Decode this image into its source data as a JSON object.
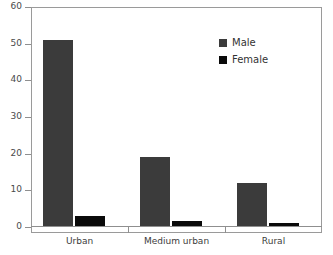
{
  "chart_data": {
    "type": "bar",
    "title": "",
    "subtitle": "",
    "xlabel": "",
    "ylabel": "",
    "categories": [
      "Urban",
      "Medium urban",
      "Rural"
    ],
    "series": [
      {
        "name": "Male",
        "color": "#3b3b3b",
        "values": [
          51,
          19,
          12
        ]
      },
      {
        "name": "Female",
        "color": "#0a0a0a",
        "values": [
          3,
          1.7,
          1.2
        ]
      }
    ],
    "ylim": [
      0,
      60
    ],
    "yticks": [
      0,
      10,
      20,
      30,
      40,
      50,
      60
    ],
    "ytick_labels": [
      "0",
      "10",
      "20",
      "30",
      "40",
      "50",
      "60"
    ],
    "grid": false,
    "legend": {
      "position": "upper-right-inside",
      "entries": [
        {
          "label": "Male",
          "swatch": "male-swatch",
          "color": "#3b3b3b"
        },
        {
          "label": "Female",
          "swatch": "female-swatch",
          "color": "#0a0a0a"
        }
      ]
    },
    "axis_color": "#8f8f8f",
    "frame_color": "#9a9a9a",
    "background": "#ffffff"
  }
}
